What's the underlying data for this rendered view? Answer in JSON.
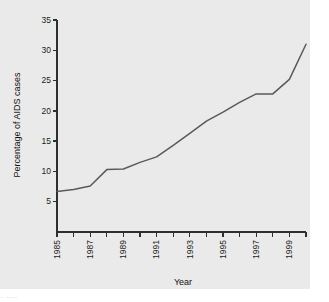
{
  "figure": {
    "background_color": "#eaeaea",
    "page_background_color": "#ffffff",
    "line_color": "#5a5a5a",
    "axis_color": "#2e2e2e"
  },
  "bottom_artifact": {
    "text": "·  ···· "
  },
  "chart_data": {
    "type": "line",
    "title": "",
    "xlabel": "Year",
    "ylabel": "Percentage of AIDS cases",
    "xlim": [
      1985,
      2000
    ],
    "ylim": [
      0,
      35
    ],
    "grid": false,
    "legend": "none",
    "y_ticks": [
      5,
      10,
      15,
      20,
      25,
      30,
      35
    ],
    "y_tick_labels": [
      "5",
      "10",
      "15",
      "20",
      "25",
      "30",
      "35"
    ],
    "x_ticks": [
      1985,
      1986,
      1987,
      1988,
      1989,
      1990,
      1991,
      1992,
      1993,
      1994,
      1995,
      1996,
      1997,
      1998,
      1999,
      2000
    ],
    "x_tick_labels": [
      "1985",
      "",
      "1987",
      "",
      "1989",
      "",
      "1991",
      "",
      "1993",
      "",
      "1995",
      "",
      "1997",
      "",
      "1999",
      ""
    ],
    "x_tick_label_rotation": 90,
    "x": [
      1985,
      1986,
      1987,
      1988,
      1989,
      1990,
      1991,
      1992,
      1993,
      1994,
      1995,
      1996,
      1997,
      1998,
      1999,
      2000
    ],
    "values": [
      6.7,
      7.0,
      7.6,
      10.3,
      10.4,
      11.5,
      12.4,
      14.3,
      16.3,
      18.3,
      19.8,
      21.4,
      22.8,
      22.8,
      25.2,
      31.0
    ],
    "series": [
      {
        "name": "Percentage of AIDS cases",
        "values": [
          6.7,
          7.0,
          7.6,
          10.3,
          10.4,
          11.5,
          12.4,
          14.3,
          16.3,
          18.3,
          19.8,
          21.4,
          22.8,
          22.8,
          25.2,
          31.0
        ]
      }
    ]
  }
}
